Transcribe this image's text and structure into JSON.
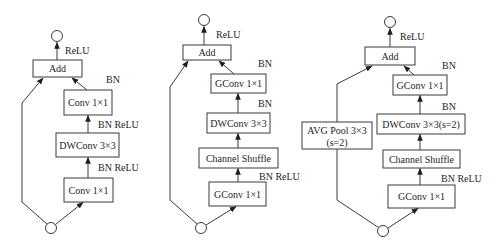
{
  "figure": {
    "diagrams": [
      {
        "name": "mobilenet-v2-block",
        "add": "Add",
        "out_act": "ReLU",
        "add_in_norm": "BN",
        "top_conv": "Conv 1×1",
        "mid_post": "BN ReLU",
        "mid_conv": "DWConv 3×3",
        "bottom_post": "BN ReLU",
        "bottom_conv": "Conv 1×1"
      },
      {
        "name": "shufflenet-unit",
        "add": "Add",
        "out_act": "ReLU",
        "add_in_norm": "BN",
        "top_conv": "GConv 1×1",
        "mid_post": "BN",
        "mid_conv": "DWConv 3×3",
        "shuffle": "Channel Shuffle",
        "bottom_post": "BN ReLU",
        "bottom_conv": "GConv 1×1"
      },
      {
        "name": "shufflenet-unit-stride2",
        "add": "Add",
        "out_act": "ReLU",
        "add_in_norm": "BN",
        "top_conv": "GConv 1×1",
        "mid_post": "BN",
        "mid_conv": "DWConv 3×3(s=2)",
        "shuffle": "Channel Shuffle",
        "bottom_post": "BN ReLU",
        "bottom_conv": "GConv 1×1",
        "pool_line1": "AVG Pool 3×3",
        "pool_line2": "(s=2)"
      }
    ]
  }
}
